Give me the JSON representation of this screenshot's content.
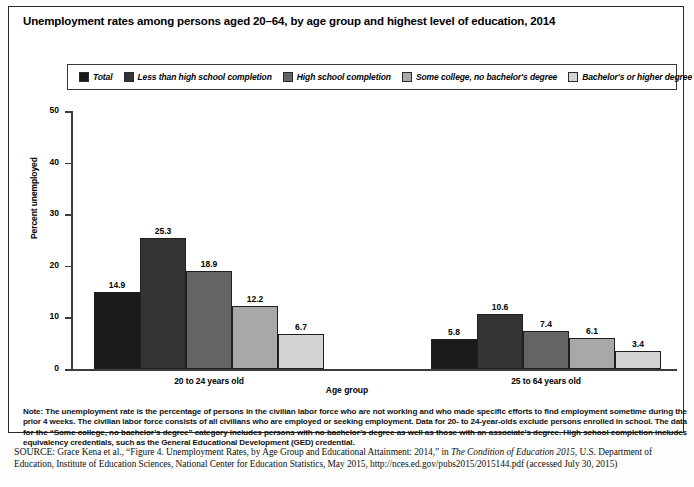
{
  "figure": {
    "title": "Unemployment rates among persons aged 20–64, by age group and highest level of education, 2014",
    "xlabel": "Age group",
    "ylabel": "Percent unemployed"
  },
  "legend": [
    {
      "label": "Total",
      "color": "#1a1a1a"
    },
    {
      "label": "Less than high school completion",
      "color": "#343434"
    },
    {
      "label": "High school completion",
      "color": "#646464"
    },
    {
      "label": "Some college, no bachelor's degree",
      "color": "#a8a8a8"
    },
    {
      "label": "Bachelor's or higher degree",
      "color": "#d4d4d4"
    }
  ],
  "yticks": [
    "0",
    "10",
    "20",
    "30",
    "40",
    "50"
  ],
  "note": {
    "prefix": "Note:",
    "text": " The unemployment rate is the percentage of persons in the civilian labor force who are not working and who made specific efforts to find employment sometime during the prior 4 weeks. The civilian labor force consists of all civilians who are employed or seeking employment. Data for 20- to 24-year-olds exclude persons enrolled in school. The data for the “Some college, no bachelor’s degree” category includes persons with no bachelor’s degree as well as those with an associate’s degree. High school completion includes equivalency credentials, such as the General Educational Development (GED) credential."
  },
  "source": {
    "prefix": "SOURCE:",
    "part1": " Grace Kena et al., “Figure 4. Unemployment Rates, by Age Group and Educational Attainment: 2014,” in ",
    "italic1": "The Condition of Education 2015",
    "part2": ", U.S. Department of Education, Institute of Education Sciences, National Center for Education Statistics, May 2015, http://nces.ed.gov/pubs2015/2015144.pdf (accessed July 30, 2015)"
  },
  "chart_data": {
    "type": "bar",
    "title": "Unemployment rates among persons aged 20–64, by age group and highest level of education, 2014",
    "xlabel": "Age group",
    "ylabel": "Percent unemployed",
    "ylim": [
      0,
      50
    ],
    "ytick_values": [
      0,
      10,
      20,
      30,
      40,
      50
    ],
    "grid": false,
    "legend_position": "top",
    "categories": [
      "20 to 24 years old",
      "25 to 64 years old"
    ],
    "series": [
      {
        "name": "Total",
        "color": "#1a1a1a",
        "values": [
          14.9,
          5.8
        ]
      },
      {
        "name": "Less than high school completion",
        "color": "#343434",
        "values": [
          25.3,
          10.6
        ]
      },
      {
        "name": "High school completion",
        "color": "#646464",
        "values": [
          18.9,
          7.4
        ]
      },
      {
        "name": "Some college, no bachelor's degree",
        "color": "#a8a8a8",
        "values": [
          12.2,
          6.1
        ]
      },
      {
        "name": "Bachelor's or higher degree",
        "color": "#d4d4d4",
        "values": [
          6.7,
          3.4
        ]
      }
    ]
  }
}
